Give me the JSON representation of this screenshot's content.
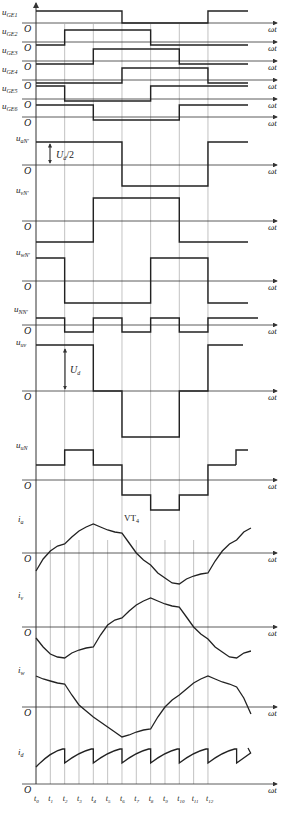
{
  "figure": {
    "axis_label": "ωt",
    "origin_label": "O",
    "annotation_vt": "VT",
    "annotation_vt_sub": "4",
    "ud_half_label": "U",
    "ud_half_sub": "d",
    "ud_half_suffix": "/2",
    "ud_label": "U",
    "ud_sub": "d",
    "time_ticks": [
      "t0",
      "t1",
      "t2",
      "t3",
      "t4",
      "t5",
      "t6",
      "t7",
      "t8",
      "t9",
      "t10",
      "t11",
      "t12"
    ],
    "time_tick_base": "t",
    "time_tick_subs": [
      "0",
      "1",
      "2",
      "3",
      "4",
      "5",
      "6",
      "7",
      "8",
      "9",
      "10",
      "11",
      "12"
    ],
    "panels": [
      {
        "id": "uGE1",
        "label": "u",
        "sub": "GE1",
        "kind": "gate",
        "levels": [
          1,
          1,
          1,
          1,
          1,
          1,
          0,
          0,
          0,
          0,
          0,
          0,
          1,
          1,
          1
        ]
      },
      {
        "id": "uGE2",
        "label": "u",
        "sub": "GE2",
        "kind": "gate"
      },
      {
        "id": "uGE3",
        "label": "u",
        "sub": "GE3",
        "kind": "gate"
      },
      {
        "id": "uGE4",
        "label": "u",
        "sub": "GE4",
        "kind": "gate"
      },
      {
        "id": "uGE5",
        "label": "u",
        "sub": "GE5",
        "kind": "gate"
      },
      {
        "id": "uGE6",
        "label": "u",
        "sub": "GE6",
        "kind": "gate"
      },
      {
        "id": "uaN",
        "label": "u",
        "sub": "aN'",
        "kind": "phase"
      },
      {
        "id": "uvN",
        "label": "u",
        "sub": "vN'",
        "kind": "phase"
      },
      {
        "id": "uwN",
        "label": "u",
        "sub": "wN'",
        "kind": "phase"
      },
      {
        "id": "uNN",
        "label": "u",
        "sub": "NN'",
        "kind": "neutral"
      },
      {
        "id": "uuv",
        "label": "u",
        "sub": "uv",
        "kind": "line"
      },
      {
        "id": "uuN",
        "label": "u",
        "sub": "uN",
        "kind": "phase-load"
      },
      {
        "id": "ia",
        "label": "i",
        "sub": "a",
        "kind": "current"
      },
      {
        "id": "iv",
        "label": "i",
        "sub": "v",
        "kind": "current"
      },
      {
        "id": "iw",
        "label": "i",
        "sub": "w",
        "kind": "current"
      },
      {
        "id": "id",
        "label": "i",
        "sub": "d",
        "kind": "dc-current"
      }
    ],
    "waveforms_sixth_period_states": {
      "uGE1": [
        1,
        1,
        1,
        0,
        0,
        0,
        1
      ],
      "uGE2": [
        0,
        1,
        1,
        1,
        0,
        0,
        0
      ],
      "uGE3": [
        0,
        0,
        1,
        1,
        1,
        0,
        0
      ],
      "uGE4": [
        0,
        0,
        0,
        1,
        1,
        1,
        0
      ],
      "uGE5": [
        1,
        0,
        0,
        0,
        1,
        1,
        1
      ],
      "uGE6": [
        1,
        1,
        0,
        0,
        0,
        1,
        1
      ],
      "uaN": [
        1,
        1,
        1,
        -1,
        -1,
        -1,
        1
      ],
      "uvN": [
        -1,
        -1,
        1,
        1,
        1,
        -1,
        -1
      ],
      "uwN": [
        1,
        -1,
        -1,
        -1,
        1,
        1,
        -1
      ],
      "uNN": [
        1,
        -1,
        1,
        -1,
        1,
        -1,
        1
      ],
      "uuv": [
        1,
        1,
        0,
        -1,
        -1,
        0,
        1
      ],
      "uuN": [
        1,
        2,
        1,
        -1,
        -2,
        -1,
        1
      ]
    },
    "caption": ""
  }
}
